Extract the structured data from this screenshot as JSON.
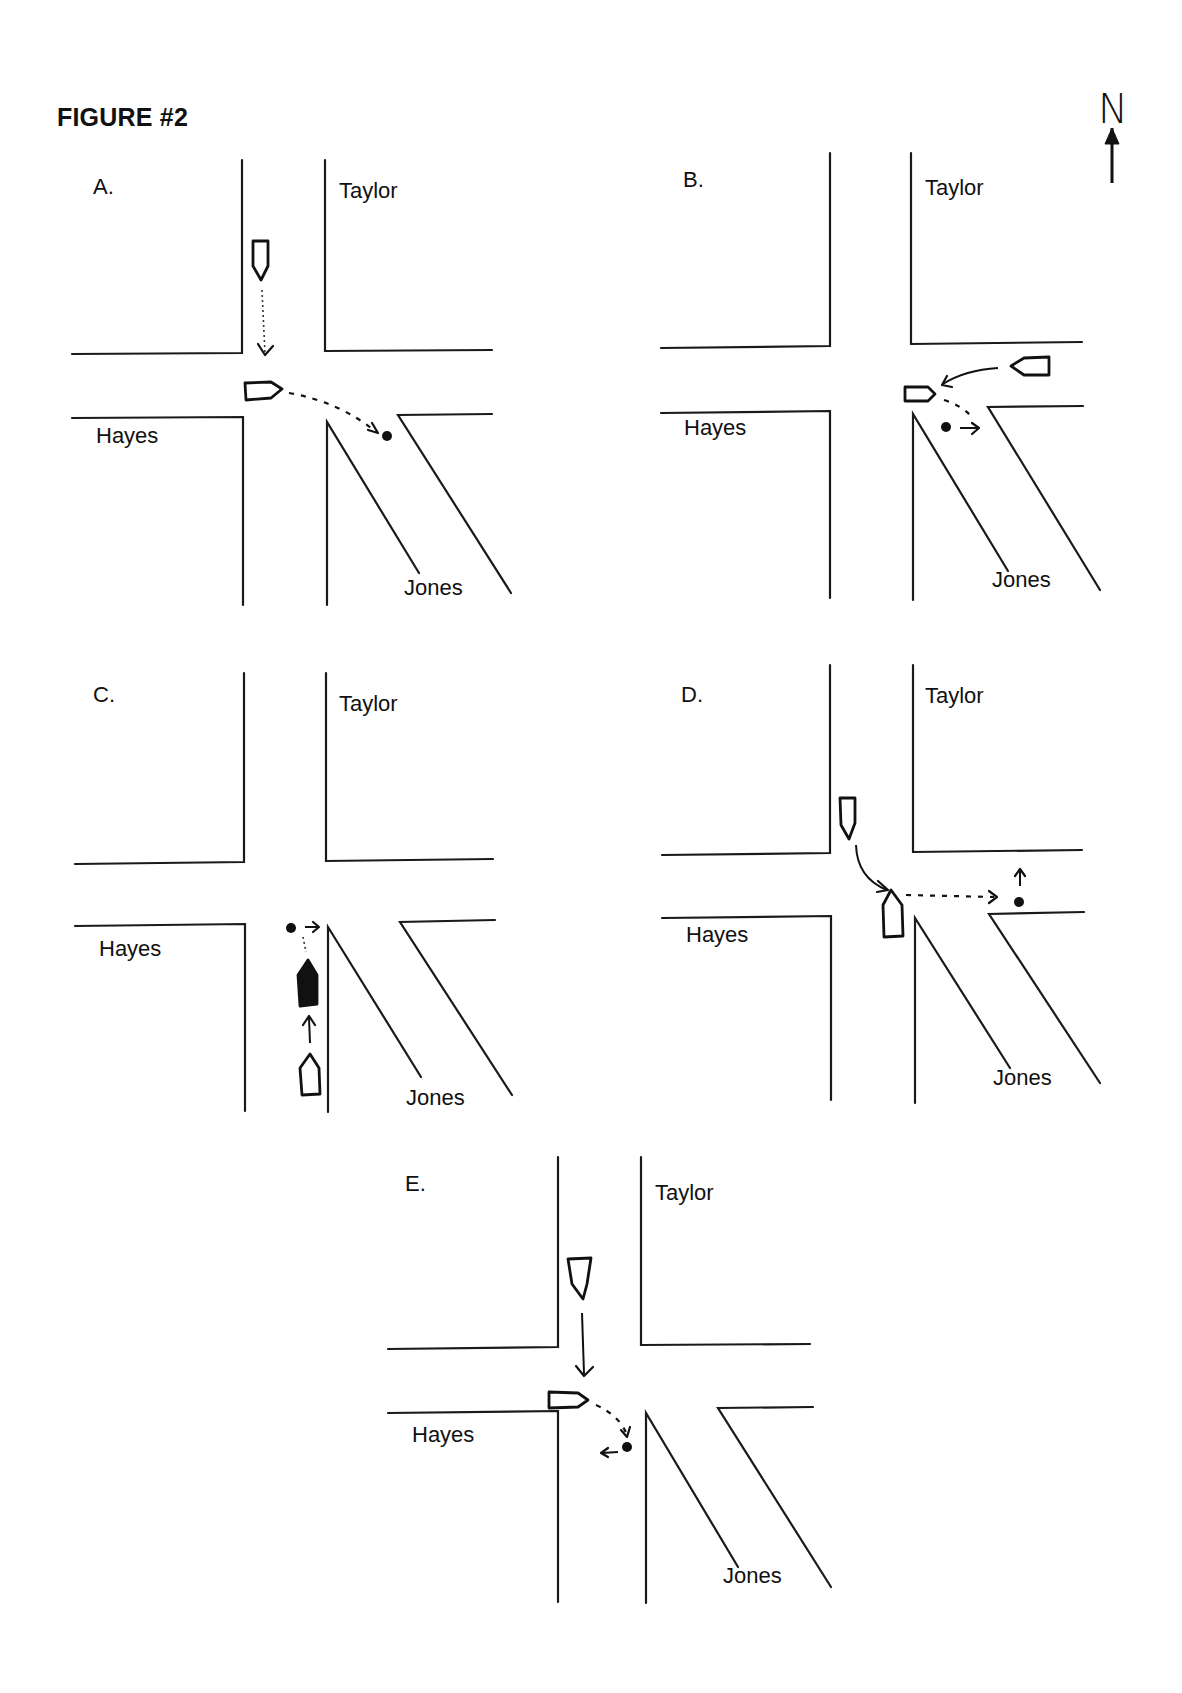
{
  "figure": {
    "title": "FIGURE #2",
    "north_label": "N"
  },
  "panels": [
    {
      "id": "A",
      "label": "A.",
      "label_pos": [
        93,
        194
      ],
      "streets": {
        "north": {
          "name": "Taylor",
          "pos": [
            339,
            198
          ]
        },
        "west": {
          "name": "Hayes",
          "pos": [
            96,
            443
          ]
        },
        "southeast": {
          "name": "Jones",
          "pos": [
            404,
            595
          ]
        }
      },
      "roads": [
        [
          [
            242,
            160
          ],
          [
            242,
            353
          ],
          [
            72,
            354
          ]
        ],
        [
          [
            325,
            160
          ],
          [
            325,
            351
          ],
          [
            492,
            350
          ]
        ],
        [
          [
            72,
            418
          ],
          [
            243,
            417
          ],
          [
            243,
            605
          ]
        ],
        [
          [
            327,
            605
          ],
          [
            327,
            422
          ],
          [
            419,
            573
          ]
        ],
        [
          [
            511,
            593
          ],
          [
            398,
            415
          ],
          [
            492,
            414
          ]
        ]
      ],
      "vehicles": [
        {
          "name": "vehicle-southbound",
          "points": [
            [
              253,
              241
            ],
            [
              268,
              241
            ],
            [
              268,
              266
            ],
            [
              261,
              280
            ],
            [
              253,
              266
            ]
          ],
          "filled": false
        },
        {
          "name": "vehicle-eastbound",
          "points": [
            [
              245,
              383
            ],
            [
              271,
              382
            ],
            [
              282,
              389
            ],
            [
              271,
              398
            ],
            [
              246,
              400
            ]
          ],
          "filled": false
        }
      ],
      "paths": [
        {
          "type": "dot",
          "d": "M262,290 L265,354"
        },
        {
          "type": "dash",
          "d": "M289,393 Q340,402 376,432"
        }
      ],
      "arrowheads": [
        "M258,344 L265,355 L273,346",
        "M368,430 L378,433 L372,423"
      ],
      "pedestrians": [
        [
          387,
          436
        ]
      ]
    },
    {
      "id": "B",
      "label": "B.",
      "label_pos": [
        683,
        187
      ],
      "streets": {
        "north": {
          "name": "Taylor",
          "pos": [
            925,
            195
          ]
        },
        "west": {
          "name": "Hayes",
          "pos": [
            684,
            435
          ]
        },
        "southeast": {
          "name": "Jones",
          "pos": [
            992,
            587
          ]
        }
      },
      "roads": [
        [
          [
            830,
            153
          ],
          [
            830,
            346
          ],
          [
            661,
            348
          ]
        ],
        [
          [
            911,
            153
          ],
          [
            911,
            344
          ],
          [
            1082,
            342
          ]
        ],
        [
          [
            661,
            413
          ],
          [
            830,
            411
          ],
          [
            830,
            598
          ]
        ],
        [
          [
            913,
            600
          ],
          [
            913,
            414
          ],
          [
            1008,
            571
          ]
        ],
        [
          [
            1100,
            590
          ],
          [
            988,
            407
          ],
          [
            1083,
            406
          ]
        ]
      ],
      "vehicles": [
        {
          "name": "vehicle-westbound",
          "points": [
            [
              1049,
              357
            ],
            [
              1049,
              375
            ],
            [
              1024,
              375
            ],
            [
              1011,
              366
            ],
            [
              1024,
              358
            ]
          ],
          "filled": false
        },
        {
          "name": "vehicle-eastbound",
          "points": [
            [
              905,
              387
            ],
            [
              928,
              387
            ],
            [
              935,
              394
            ],
            [
              928,
              401
            ],
            [
              905,
              401
            ]
          ],
          "filled": false
        }
      ],
      "paths": [
        {
          "type": "solid",
          "d": "M998,368 Q965,370 943,384"
        },
        {
          "type": "dash",
          "d": "M944,400 Q960,405 970,415"
        },
        {
          "type": "solid",
          "d": "M960,428 L978,428"
        }
      ],
      "arrowheads": [
        "M947,376 L942,385 L952,387",
        "M972,423 L979,428 L972,434"
      ],
      "pedestrians": [
        [
          946,
          427
        ]
      ]
    },
    {
      "id": "C",
      "label": "C.",
      "label_pos": [
        93,
        702
      ],
      "streets": {
        "north": {
          "name": "Taylor",
          "pos": [
            339,
            711
          ]
        },
        "west": {
          "name": "Hayes",
          "pos": [
            99,
            956
          ]
        },
        "southeast": {
          "name": "Jones",
          "pos": [
            406,
            1105
          ]
        }
      },
      "roads": [
        [
          [
            244,
            673
          ],
          [
            244,
            862
          ],
          [
            75,
            864
          ]
        ],
        [
          [
            326,
            673
          ],
          [
            326,
            861
          ],
          [
            493,
            859
          ]
        ],
        [
          [
            75,
            926
          ],
          [
            245,
            924
          ],
          [
            245,
            1111
          ]
        ],
        [
          [
            328,
            1112
          ],
          [
            328,
            927
          ],
          [
            421,
            1077
          ]
        ],
        [
          [
            512,
            1095
          ],
          [
            400,
            922
          ],
          [
            495,
            920
          ]
        ]
      ],
      "vehicles": [
        {
          "name": "vehicle-northbound-filled",
          "points": [
            [
              308,
              960
            ],
            [
              317,
              975
            ],
            [
              317,
              1004
            ],
            [
              300,
              1006
            ],
            [
              298,
              975
            ]
          ],
          "filled": true
        },
        {
          "name": "vehicle-northbound",
          "points": [
            [
              310,
              1054
            ],
            [
              319,
              1068
            ],
            [
              320,
              1094
            ],
            [
              302,
              1095
            ],
            [
              300,
              1068
            ]
          ],
          "filled": false
        }
      ],
      "paths": [
        {
          "type": "dot",
          "d": "M303,937 L306,952"
        },
        {
          "type": "solid",
          "d": "M305,927 L318,927"
        },
        {
          "type": "solid",
          "d": "M309,1018 L310,1043"
        }
      ],
      "arrowheads": [
        "M313,922 L319,927 L313,932",
        "M303,1025 L309,1016 L315,1025"
      ],
      "pedestrians": [
        [
          291,
          928
        ]
      ]
    },
    {
      "id": "D",
      "label": "D.",
      "label_pos": [
        681,
        702
      ],
      "streets": {
        "north": {
          "name": "Taylor",
          "pos": [
            925,
            703
          ]
        },
        "west": {
          "name": "Hayes",
          "pos": [
            686,
            942
          ]
        },
        "southeast": {
          "name": "Jones",
          "pos": [
            993,
            1085
          ]
        }
      },
      "roads": [
        [
          [
            830,
            665
          ],
          [
            830,
            853
          ],
          [
            662,
            855
          ]
        ],
        [
          [
            913,
            665
          ],
          [
            913,
            852
          ],
          [
            1082,
            850
          ]
        ],
        [
          [
            662,
            918
          ],
          [
            831,
            916
          ],
          [
            831,
            1100
          ]
        ],
        [
          [
            915,
            1103
          ],
          [
            915,
            918
          ],
          [
            1010,
            1068
          ]
        ],
        [
          [
            1100,
            1083
          ],
          [
            989,
            914
          ],
          [
            1084,
            912
          ]
        ]
      ],
      "vehicles": [
        {
          "name": "vehicle-southbound",
          "points": [
            [
              840,
              798
            ],
            [
              855,
              798
            ],
            [
              855,
              823
            ],
            [
              849,
              839
            ],
            [
              841,
              825
            ]
          ],
          "filled": false
        },
        {
          "name": "vehicle-northbound",
          "points": [
            [
              891,
              890
            ],
            [
              902,
              905
            ],
            [
              903,
              936
            ],
            [
              884,
              937
            ],
            [
              883,
              905
            ]
          ],
          "filled": false
        }
      ],
      "paths": [
        {
          "type": "solid",
          "d": "M856,845 Q857,878 887,890"
        },
        {
          "type": "dash",
          "d": "M906,895 L994,897"
        },
        {
          "type": "solid",
          "d": "M1020,871 L1020,886"
        }
      ],
      "arrowheads": [
        "M878,881 L888,890 L877,892",
        "M989,891 L997,897 L989,903",
        "M1015,876 L1020,869 L1025,876"
      ],
      "pedestrians": [
        [
          1019,
          902
        ]
      ]
    },
    {
      "id": "E",
      "label": "E.",
      "label_pos": [
        405,
        1191
      ],
      "streets": {
        "north": {
          "name": "Taylor",
          "pos": [
            655,
            1200
          ]
        },
        "west": {
          "name": "Hayes",
          "pos": [
            412,
            1442
          ]
        },
        "southeast": {
          "name": "Jones",
          "pos": [
            723,
            1583
          ]
        }
      },
      "roads": [
        [
          [
            558,
            1157
          ],
          [
            558,
            1347
          ],
          [
            388,
            1349
          ]
        ],
        [
          [
            641,
            1157
          ],
          [
            641,
            1345
          ],
          [
            810,
            1344
          ]
        ],
        [
          [
            388,
            1413
          ],
          [
            558,
            1411
          ],
          [
            558,
            1602
          ]
        ],
        [
          [
            646,
            1603
          ],
          [
            646,
            1413
          ],
          [
            738,
            1567
          ]
        ],
        [
          [
            831,
            1587
          ],
          [
            718,
            1408
          ],
          [
            813,
            1407
          ]
        ]
      ],
      "vehicles": [
        {
          "name": "vehicle-southbound",
          "points": [
            [
              568,
              1259
            ],
            [
              591,
              1258
            ],
            [
              587,
              1284
            ],
            [
              583,
              1299
            ],
            [
              572,
              1284
            ]
          ],
          "filled": false
        },
        {
          "name": "vehicle-eastbound",
          "points": [
            [
              549,
              1392
            ],
            [
              578,
              1393
            ],
            [
              588,
              1400
            ],
            [
              578,
              1407
            ],
            [
              549,
              1408
            ]
          ],
          "filled": false
        }
      ],
      "paths": [
        {
          "type": "solid",
          "d": "M582,1313 L584,1374"
        },
        {
          "type": "dash",
          "d": "M596,1405 Q620,1416 627,1435"
        },
        {
          "type": "solid",
          "d": "M618,1452 L602,1453"
        }
      ],
      "arrowheads": [
        "M576,1366 L584,1376 L593,1367",
        "M621,1430 L627,1437 L630,1427",
        "M608,1448 L601,1453 L608,1457"
      ],
      "pedestrians": [
        [
          627,
          1447
        ]
      ]
    }
  ],
  "compass": {
    "arrow_d": "M1112,128 L1112,183",
    "arrow_head": "M1105,144 L1112,128 L1119,144 Z"
  }
}
